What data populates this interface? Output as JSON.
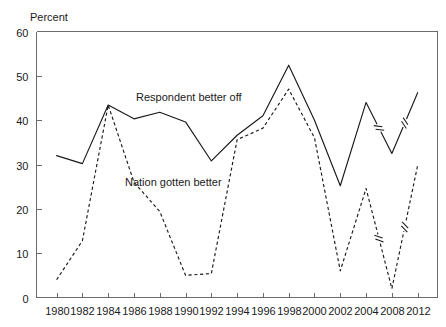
{
  "chart_data": {
    "type": "line",
    "title": "",
    "ylabel": "Percent",
    "xlabel": "",
    "ylim": [
      0,
      60
    ],
    "yticks": [
      0,
      10,
      20,
      30,
      40,
      50,
      60
    ],
    "ytick_labels": [
      "0",
      "10",
      "20",
      "30",
      "40",
      "50",
      "60"
    ],
    "grid": false,
    "legend_position": "inline-annotation",
    "x": [
      1980,
      1982,
      1984,
      1986,
      1988,
      1990,
      1992,
      1994,
      1996,
      1998,
      2000,
      2002,
      2004,
      2008,
      2012
    ],
    "xtick_labels": [
      "1980",
      "1982",
      "1984",
      "1986",
      "1988",
      "1990",
      "1992",
      "1994",
      "1996",
      "1998",
      "2000",
      "2002",
      "2004",
      "2008",
      "2012"
    ],
    "axis_breaks": [
      {
        "between": [
          "2004",
          "2008"
        ],
        "note": "year 2006 omitted"
      },
      {
        "between": [
          "2008",
          "2012"
        ],
        "note": "year 2010 omitted"
      }
    ],
    "series": [
      {
        "name": "Respondent better off",
        "style": "solid",
        "color": "#1a1a1a",
        "values": [
          32.0,
          30.2,
          43.4,
          40.3,
          41.8,
          39.6,
          30.8,
          36.6,
          41.0,
          52.4,
          40.0,
          25.2,
          44.0,
          32.5,
          46.2
        ],
        "label_text": "Respondent better off",
        "label_x_px": 136,
        "label_y_px": 101
      },
      {
        "name": "Nation gotten better",
        "style": "dashed",
        "color": "#1a1a1a",
        "values": [
          4.0,
          12.8,
          43.4,
          26.0,
          19.4,
          5.0,
          5.4,
          35.6,
          38.2,
          47.0,
          36.0,
          6.0,
          24.6,
          2.0,
          29.8
        ],
        "label_text": "Nation gotten better",
        "label_x_px": 125,
        "label_y_px": 186
      }
    ]
  },
  "axis_titles": {
    "y_unit": "Percent"
  }
}
